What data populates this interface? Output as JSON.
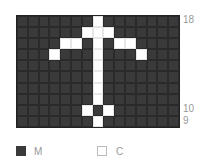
{
  "chart": {
    "title": "",
    "columns": 15,
    "rows": 10,
    "row_numbers_top_to_bottom": [
      18,
      17,
      16,
      15,
      14,
      13,
      12,
      11,
      10,
      9
    ],
    "visible_row_labels": [
      {
        "row": 18,
        "label": "18"
      },
      {
        "row": 10,
        "label": "10"
      },
      {
        "row": 9,
        "label": "9"
      }
    ],
    "pattern_top_to_bottom": [
      "MMMMMMMCMMMMMMM",
      "MMMMMMCCCMMMMMM",
      "MMMMCCMCMCCMMMM",
      "MMMCMMMCMMMCMMM",
      "MMMMMMMCMMMMMMM",
      "MMMMMMMCMMMMMMM",
      "MMMMMMMCMMMMMMM",
      "MMMMMMMCMMMMMMM",
      "MMMMMMCMCMMMMMM",
      "MMMMMMMCMMMMMMM"
    ],
    "colors": {
      "M": "#3a3a3a",
      "C": "#ffffff"
    }
  },
  "legend": [
    {
      "key": "M",
      "label": "M",
      "color": "#3a3a3a"
    },
    {
      "key": "C",
      "label": "C",
      "color": "#ffffff"
    }
  ]
}
